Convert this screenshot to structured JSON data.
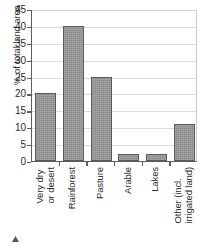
{
  "chart_data": {
    "type": "bar",
    "title": "",
    "subtitle": "",
    "xlabel": "",
    "ylabel": "% of total land area",
    "categories": [
      "Very dry or desert",
      "Rainforest",
      "Pasture",
      "Arable",
      "Lakes",
      "Other (incl. irrigated land)"
    ],
    "category_lines": [
      [
        "Very dry",
        "or desert"
      ],
      [
        "Rainforest"
      ],
      [
        "Pasture"
      ],
      [
        "Arable"
      ],
      [
        "Lakes"
      ],
      [
        "Other (incl.",
        "irrigated land)"
      ]
    ],
    "values": [
      20,
      40,
      25,
      2,
      2,
      11
    ],
    "ylim": [
      0,
      45
    ],
    "ytick_step": 5,
    "yticks": [
      0,
      5,
      10,
      15,
      20,
      25,
      30,
      35,
      40,
      45
    ],
    "ytick_labels": [
      "0",
      "5",
      "10",
      "15",
      "20",
      "25",
      "30",
      "35",
      "40",
      "45"
    ],
    "grid": true,
    "grid_axis": "y",
    "legend": false,
    "legend_position": "none",
    "bar_color": "#8a8a8a",
    "bar_border_color": "#5a5a5a",
    "axis_color": "#5d5d5d",
    "gridline_color": "#dcdcdc",
    "text_color": "#2b2b2b",
    "background_color": "#ffffff"
  }
}
